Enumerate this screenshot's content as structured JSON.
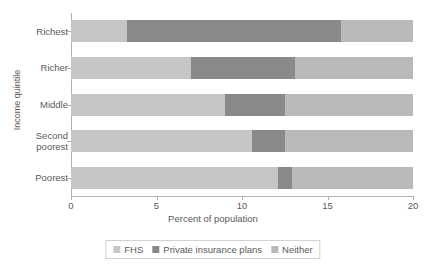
{
  "chart_data": {
    "type": "bar",
    "orientation": "horizontal",
    "stacked": true,
    "title": "",
    "xlabel": "Percent of population",
    "ylabel": "Income quintile",
    "categories": [
      "Richest",
      "Richer",
      "Middle",
      "Second poorest",
      "Poorest"
    ],
    "xlim": [
      0,
      20
    ],
    "xticks": [
      0,
      5,
      10,
      15,
      20
    ],
    "xticklabels": [
      "0",
      "5",
      "10",
      "15",
      "20"
    ],
    "grid": false,
    "legend_position": "bottom",
    "series": [
      {
        "name": "FHS",
        "color": "#c6c6c6",
        "values": [
          3.3,
          7.0,
          9.0,
          10.6,
          12.1
        ]
      },
      {
        "name": "Private insurance plans",
        "color": "#898989",
        "values": [
          12.5,
          6.1,
          3.5,
          1.9,
          0.8
        ]
      },
      {
        "name": "Neither",
        "color": "#b9b9b9",
        "values": [
          4.2,
          6.9,
          7.5,
          7.5,
          7.1
        ]
      }
    ]
  },
  "legend": {
    "items": [
      {
        "label": "FHS"
      },
      {
        "label": "Private insurance plans"
      },
      {
        "label": "Neither"
      }
    ]
  }
}
